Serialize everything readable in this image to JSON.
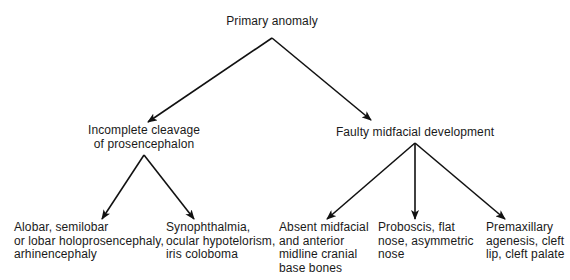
{
  "diagram": {
    "type": "tree",
    "root": {
      "id": "primary",
      "label": "Primary anomaly"
    },
    "level1": [
      {
        "id": "cleavage",
        "lines": [
          "Incomplete cleavage",
          "of prosencephalon"
        ]
      },
      {
        "id": "midfacial",
        "lines": [
          "Faulty midfacial development"
        ]
      }
    ],
    "leaves": [
      {
        "id": "holoprosencephaly",
        "parent": "cleavage",
        "lines": [
          "Alobar, semilobar",
          "or lobar holoprosencephaly,",
          "arhinencephaly"
        ]
      },
      {
        "id": "synophthalmia",
        "parent": "cleavage",
        "lines": [
          "Synophthalmia,",
          "ocular hypotelorism,",
          "iris coloboma"
        ]
      },
      {
        "id": "absent-midfacial",
        "parent": "midfacial",
        "lines": [
          "Absent midfacial",
          "and anterior",
          "midline cranial",
          "base bones"
        ]
      },
      {
        "id": "proboscis",
        "parent": "midfacial",
        "lines": [
          "Proboscis, flat",
          "nose, asymmetric",
          "nose"
        ]
      },
      {
        "id": "premaxillary",
        "parent": "midfacial",
        "lines": [
          "Premaxillary",
          "agenesis, cleft",
          "lip, cleft palate"
        ]
      }
    ],
    "edges": [
      {
        "from": "primary",
        "to": "cleavage",
        "x1": 272,
        "y1": 38,
        "x2": 148,
        "y2": 122
      },
      {
        "from": "primary",
        "to": "midfacial",
        "x1": 272,
        "y1": 38,
        "x2": 371,
        "y2": 120
      },
      {
        "from": "cleavage",
        "to": "holoprosencephaly",
        "x1": 144,
        "y1": 155,
        "x2": 102,
        "y2": 219
      },
      {
        "from": "cleavage",
        "to": "synophthalmia",
        "x1": 144,
        "y1": 155,
        "x2": 194,
        "y2": 219
      },
      {
        "from": "midfacial",
        "to": "absent-midfacial",
        "x1": 415,
        "y1": 143,
        "x2": 327,
        "y2": 219
      },
      {
        "from": "midfacial",
        "to": "proboscis",
        "x1": 415,
        "y1": 143,
        "x2": 415,
        "y2": 219
      },
      {
        "from": "midfacial",
        "to": "premaxillary",
        "x1": 415,
        "y1": 143,
        "x2": 505,
        "y2": 219
      }
    ],
    "colors": {
      "line": "#111111",
      "text": "#1a1a1a",
      "background": "#ffffff"
    }
  }
}
